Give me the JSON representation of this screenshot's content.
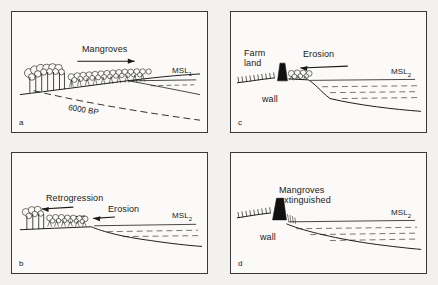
{
  "figure": {
    "type": "scientific-diagram",
    "background_color": "#f2f1ee",
    "ink_color": "#1a1a1a",
    "panel_count": 4
  },
  "panels": {
    "a": {
      "letter": "a",
      "labels": {
        "mangroves": "Mangroves",
        "msl": "MSL",
        "msl_sub": "1",
        "bp": "6000 BP"
      },
      "arrows": [
        {
          "name": "progradation-arrow",
          "direction": "right"
        }
      ],
      "features": [
        "tall-forest",
        "mangrove-fringe",
        "mean-sea-level-line",
        "6000-BP-palaeo-surface",
        "sloping-substrate"
      ]
    },
    "b": {
      "letter": "b",
      "labels": {
        "retrogression": "Retrogression",
        "erosion": "Erosion",
        "msl": "MSL",
        "msl_sub": "2"
      },
      "arrows": [
        {
          "name": "retrogression-arrow",
          "direction": "left"
        },
        {
          "name": "erosion-arrow-mid",
          "direction": "left"
        },
        {
          "name": "erosion-arrow-outer",
          "direction": "left"
        }
      ],
      "features": [
        "tall-forest",
        "mangrove-fringe",
        "mean-sea-level-line",
        "eroding-shore-scarp",
        "water-body"
      ]
    },
    "c": {
      "letter": "c",
      "labels": {
        "farm_land": "Farm\nland",
        "erosion": "Erosion",
        "wall": "wall",
        "msl": "MSL",
        "msl_sub": "2"
      },
      "arrows": [
        {
          "name": "erosion-arrow",
          "direction": "left"
        }
      ],
      "features": [
        "hatched-farmland",
        "sea-wall",
        "narrow-mangrove-fringe",
        "mean-sea-level-line",
        "water-body",
        "eroding-profile"
      ]
    },
    "d": {
      "letter": "d",
      "labels": {
        "mangroves_extinguished": "Mangroves\nextinguished",
        "wall": "wall",
        "msl": "MSL",
        "msl_sub": "2"
      },
      "arrows": [],
      "features": [
        "hatched-farmland",
        "sea-wall",
        "mean-sea-level-line",
        "water-body",
        "stripped-intertidal-profile"
      ]
    }
  }
}
